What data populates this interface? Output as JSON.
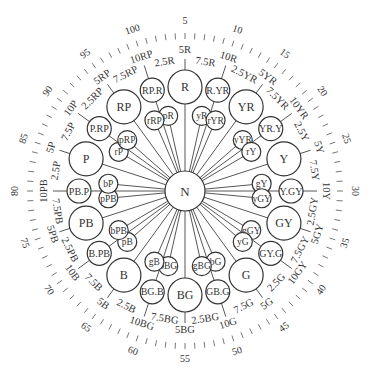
{
  "diagram": {
    "center_label": "N",
    "scale_numbers": [
      "5",
      "10",
      "15",
      "20",
      "25",
      "30",
      "35",
      "40",
      "45",
      "50",
      "55",
      "60",
      "65",
      "70",
      "75",
      "80",
      "85",
      "90",
      "95",
      "100"
    ],
    "hue_labels": [
      {
        "hue": 2.5,
        "label": "2.5R"
      },
      {
        "hue": 5,
        "label": "5R"
      },
      {
        "hue": 7.5,
        "label": "7.5R"
      },
      {
        "hue": 10,
        "label": "10R"
      },
      {
        "hue": 12.5,
        "label": "2.5YR"
      },
      {
        "hue": 15,
        "label": "5YR"
      },
      {
        "hue": 17.5,
        "label": "7.5YR"
      },
      {
        "hue": 20,
        "label": "10YR"
      },
      {
        "hue": 22.5,
        "label": "2.5Y"
      },
      {
        "hue": 25,
        "label": "5Y"
      },
      {
        "hue": 27.5,
        "label": "7.5Y"
      },
      {
        "hue": 30,
        "label": "10Y"
      },
      {
        "hue": 32.5,
        "label": "2.5GY"
      },
      {
        "hue": 35,
        "label": "5GY"
      },
      {
        "hue": 37.5,
        "label": "7.5GY"
      },
      {
        "hue": 40,
        "label": "10GY"
      },
      {
        "hue": 42.5,
        "label": "2.5G"
      },
      {
        "hue": 45,
        "label": "5G"
      },
      {
        "hue": 47.5,
        "label": "7.5G"
      },
      {
        "hue": 50,
        "label": "10G"
      },
      {
        "hue": 52.5,
        "label": "2.5BG"
      },
      {
        "hue": 55,
        "label": "5BG"
      },
      {
        "hue": 57.5,
        "label": "7.5BG"
      },
      {
        "hue": 60,
        "label": "10BG"
      },
      {
        "hue": 62.5,
        "label": "2.5B"
      },
      {
        "hue": 65,
        "label": "5B"
      },
      {
        "hue": 67.5,
        "label": "7.5B"
      },
      {
        "hue": 70,
        "label": "10B"
      },
      {
        "hue": 72.5,
        "label": "2.5PB"
      },
      {
        "hue": 75,
        "label": "5PB"
      },
      {
        "hue": 77.5,
        "label": "7.5PB"
      },
      {
        "hue": 80,
        "label": "10PB"
      },
      {
        "hue": 82.5,
        "label": "2.5P"
      },
      {
        "hue": 85,
        "label": "5P"
      },
      {
        "hue": 87.5,
        "label": "7.5P"
      },
      {
        "hue": 90,
        "label": "10P"
      },
      {
        "hue": 92.5,
        "label": "2.5RP"
      },
      {
        "hue": 95,
        "label": "5RP"
      },
      {
        "hue": 97.5,
        "label": "7.5RP"
      },
      {
        "hue": 100,
        "label": "10RP"
      }
    ],
    "major_circles": [
      {
        "hue": 5,
        "label": "R"
      },
      {
        "hue": 15,
        "label": "YR"
      },
      {
        "hue": 25,
        "label": "Y"
      },
      {
        "hue": 35,
        "label": "GY"
      },
      {
        "hue": 45,
        "label": "G"
      },
      {
        "hue": 55,
        "label": "BG"
      },
      {
        "hue": 65,
        "label": "B"
      },
      {
        "hue": 75,
        "label": "PB"
      },
      {
        "hue": 85,
        "label": "P"
      },
      {
        "hue": 95,
        "label": "RP"
      }
    ],
    "intermediate_circles": [
      {
        "hue": 10,
        "label": "R.YR"
      },
      {
        "hue": 20,
        "label": "YR.Y"
      },
      {
        "hue": 30,
        "label": "Y.GY"
      },
      {
        "hue": 40,
        "label": "GY.G"
      },
      {
        "hue": 50,
        "label": "GB.G"
      },
      {
        "hue": 60,
        "label": "BG.B"
      },
      {
        "hue": 70,
        "label": "B.PB"
      },
      {
        "hue": 80,
        "label": "PB.P"
      },
      {
        "hue": 90,
        "label": "P.RP"
      },
      {
        "hue": 100,
        "label": "RP.R"
      }
    ],
    "inner_circles": [
      {
        "hue": 1.5,
        "label": "pR"
      },
      {
        "hue": 8.5,
        "label": "yR"
      },
      {
        "hue": 11.5,
        "label": "rYR"
      },
      {
        "hue": 18.5,
        "label": "yYR"
      },
      {
        "hue": 21.5,
        "label": "rY"
      },
      {
        "hue": 28.5,
        "label": "gY"
      },
      {
        "hue": 31.5,
        "label": "yGY"
      },
      {
        "hue": 38.5,
        "label": "gGY"
      },
      {
        "hue": 41.5,
        "label": "yG"
      },
      {
        "hue": 48.5,
        "label": "bG"
      },
      {
        "hue": 51.5,
        "label": "gBG"
      },
      {
        "hue": 58.5,
        "label": "bBG"
      },
      {
        "hue": 61.5,
        "label": "gB"
      },
      {
        "hue": 68.5,
        "label": "pB"
      },
      {
        "hue": 71.5,
        "label": "bPB"
      },
      {
        "hue": 78.5,
        "label": "pPB"
      },
      {
        "hue": 81.5,
        "label": "bP"
      },
      {
        "hue": 88.5,
        "label": "rP"
      },
      {
        "hue": 91.5,
        "label": "pRP"
      },
      {
        "hue": 98.5,
        "label": "rRP"
      }
    ],
    "colors": {
      "stroke": "#333333",
      "text": "#333333",
      "background": "#ffffff"
    }
  }
}
